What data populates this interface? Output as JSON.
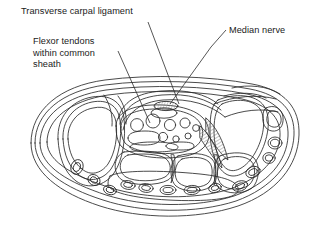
{
  "figure": {
    "name": "carpal-tunnel-cross-section",
    "background_color": "#ffffff",
    "line_color": "#2b2b2b",
    "shade_color": "#6e6e6e",
    "text_color": "#1a1a1a"
  },
  "annotations": {
    "transverse_carpal_ligament": {
      "text": "Transverse carpal ligament",
      "leader_from": [
        148,
        22
      ],
      "leader_to": [
        179,
        104
      ]
    },
    "flexor_tendons": {
      "line1": "Flexor tendons",
      "line2": "within common",
      "line3": "sheath",
      "leader_from": [
        118,
        51
      ],
      "leader_to": [
        148,
        122
      ]
    },
    "median_nerve": {
      "text": "Median nerve",
      "leader_from": [
        226,
        30
      ],
      "leader_to": [
        211,
        47
      ]
    }
  },
  "structures": [
    {
      "name": "skin-outline",
      "label": "Outer skin boundary"
    },
    {
      "name": "subcutaneous-layer",
      "label": "Subcutaneous tissue layer"
    },
    {
      "name": "transverse-carpal-ligament",
      "label": "Transverse carpal ligament (flexor retinaculum)"
    },
    {
      "name": "median-nerve",
      "label": "Median nerve"
    },
    {
      "name": "flexor-tendon-group",
      "label": "Flexor tendons within common synovial sheath"
    },
    {
      "name": "carpal-bone-row",
      "label": "Carpal bones"
    },
    {
      "name": "ulnar-compartment",
      "label": "Ulnar side compartment"
    },
    {
      "name": "radial-compartment",
      "label": "Radial side compartment"
    },
    {
      "name": "dorsal-tendon-compartments",
      "label": "Dorsal extensor tendon compartments"
    },
    {
      "name": "dorsal-vessels",
      "label": "Dorsal small vessels"
    }
  ]
}
